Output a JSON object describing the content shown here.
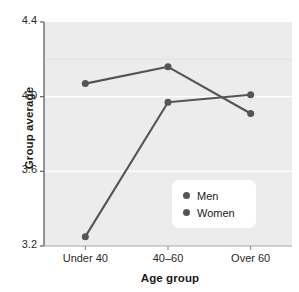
{
  "chart_data": {
    "type": "line",
    "title": "",
    "xlabel": "Age group",
    "ylabel": "Group average",
    "categories": [
      "Under 40",
      "40–60",
      "Over 60"
    ],
    "series": [
      {
        "name": "Men",
        "values": [
          4.07,
          4.16,
          3.91
        ],
        "color": "#555555"
      },
      {
        "name": "Women",
        "values": [
          3.25,
          3.97,
          4.01
        ],
        "color": "#555555"
      }
    ],
    "ylim": [
      3.2,
      4.4
    ],
    "yticks": [
      "3.2",
      "3.6",
      "4.0",
      "4.4"
    ],
    "ytick_values": [
      3.2,
      3.6,
      4.0,
      4.4
    ],
    "grid": true,
    "grid_color": "#ffffff",
    "plot_background": "#ececec",
    "legend_position": "inside-bottom-right",
    "legend_entries": [
      "Men",
      "Women"
    ]
  },
  "axes": {
    "y_title": "Group average",
    "x_title": "Age group"
  },
  "legend": {
    "items": [
      {
        "label": "Men"
      },
      {
        "label": "Women"
      }
    ]
  }
}
